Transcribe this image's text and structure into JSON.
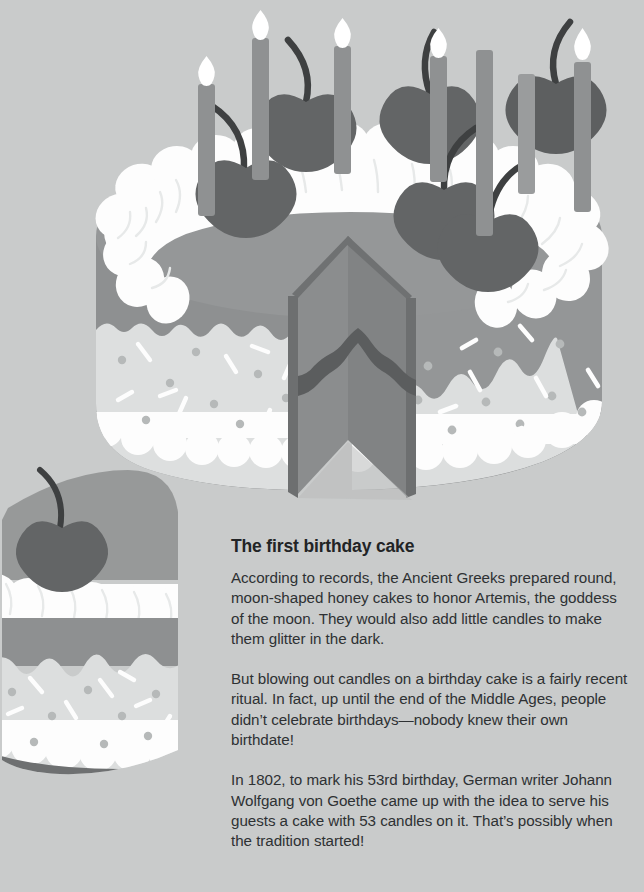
{
  "page": {
    "background_color": "#c9cbcb"
  },
  "article": {
    "heading": "The first birthday cake",
    "paragraphs": [
      "According to records, the Ancient Greeks prepared round, moon-shaped honey cakes to honor Artemis, the goddess of the moon. They would also add little candles to make them glitter in the dark.",
      "But blowing out candles on a birthday cake is a fairly recent ritual. In fact, up until the end of the Middle Ages, people didn’t celebrate birthdays—nobody knew their own birthdate!",
      "In 1802, to mark his 53rd birthday, German writer Johann Wolfgang von Goethe came up with the idea to serve his guests a cake with 53 candles on it. That’s possibly when the tradition started!"
    ]
  },
  "illustration": {
    "subject": "birthday-cake-with-slice",
    "description": "Isometric layered birthday cake with a wedge removed, topped with whipped cream swirls, cherries and lit candles; a separate cake slice sits at lower left.",
    "counts": {
      "candles": 7,
      "cherries": 6,
      "lit_flames": 4
    },
    "colors": {
      "background": "#c9cbcb",
      "cake_top": "#959798",
      "cake_side_dark": "#8e9091",
      "cream_white": "#fefefe",
      "cream_shadow": "#e9ebeb",
      "frosting_light": "#dcdede",
      "frosting_mid": "#c4c7c7",
      "sponge": "#8b8d8e",
      "sponge_shadow": "#7d7f80",
      "jam_layer": "#5b5d5e",
      "cut_edge": "#6f7172",
      "cherry": "#636566",
      "cherry_dark": "#5a5c5d",
      "stem": "#3e4041",
      "candle": "#8f9192",
      "flame": "#ffffff",
      "sprinkle_dot": "#b4b7b7",
      "base_shadow": "#6a6c6d"
    }
  }
}
